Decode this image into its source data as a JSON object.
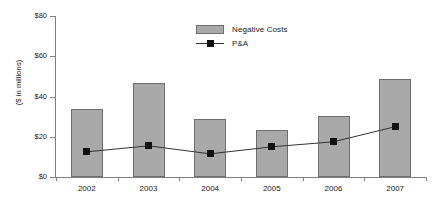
{
  "chart_data": {
    "type": "bar",
    "title": "",
    "xlabel": "",
    "ylabel": "($ in millions)",
    "categories": [
      "2002",
      "2003",
      "2004",
      "2005",
      "2006",
      "2007"
    ],
    "ylim": [
      0,
      80
    ],
    "yticks": [
      0,
      20,
      40,
      60,
      80
    ],
    "ytick_labels": [
      "$0",
      "$20",
      "$40",
      "$60",
      "$80"
    ],
    "grid": false,
    "legend_position": "top-center",
    "series": [
      {
        "name": "Negative Costs",
        "type": "bar",
        "color": "#a9a9a9",
        "values": [
          34,
          46.5,
          29,
          23.5,
          30.5,
          48.5
        ]
      },
      {
        "name": "P&A",
        "type": "line",
        "color": "#111111",
        "marker": "square",
        "values": [
          12.5,
          15.5,
          11.5,
          15,
          17.5,
          25
        ]
      }
    ]
  },
  "legend": {
    "items": [
      {
        "label": "Negative Costs",
        "swatch": "bar"
      },
      {
        "label": "P&A",
        "swatch": "line-marker"
      }
    ]
  },
  "axes": {
    "y_title": "($ in millions)"
  }
}
